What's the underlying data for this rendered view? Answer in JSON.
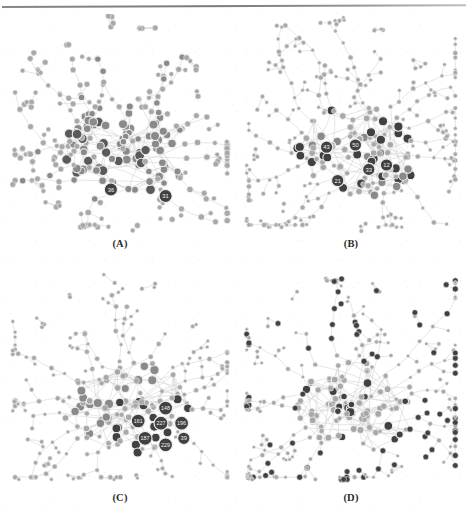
{
  "figure": {
    "kind": "network-graph-grid",
    "rows": 2,
    "columns": 2,
    "background_color": "#ffffff",
    "has_top_scan_rule": true
  },
  "chart_data": {
    "type": "scatter",
    "title": "",
    "subtitle": "",
    "xlabel": "",
    "ylabel": "",
    "grid": false,
    "legend_position": "none",
    "palette": {
      "background": "#ffffff",
      "edge": "#cfcfcf",
      "node_light": "#a8a8a8",
      "node_mid": "#8a8a8a",
      "node_dark": "#5a5a5a",
      "node_darkest": "#414141",
      "node_stroke": "#efefef",
      "label_text": "#f2f2f2",
      "caption_text": "#2c2c2c"
    },
    "panels": [
      {
        "id": "A",
        "caption": "(A)",
        "highlight_style": "graded-gray-by-degree",
        "node_count_approx": 240,
        "edge_count_approx": 300,
        "labeled_nodes": [
          {
            "label": "36",
            "x": 0.46,
            "y": 0.79
          },
          {
            "label": "31",
            "x": 0.7,
            "y": 0.82
          }
        ]
      },
      {
        "id": "B",
        "caption": "(B)",
        "highlight_style": "dark-hubs-center",
        "node_count_approx": 240,
        "edge_count_approx": 300,
        "labeled_nodes": [
          {
            "label": "43",
            "x": 0.39,
            "y": 0.6
          },
          {
            "label": "50",
            "x": 0.52,
            "y": 0.59
          },
          {
            "label": "21",
            "x": 0.44,
            "y": 0.75
          },
          {
            "label": "33",
            "x": 0.58,
            "y": 0.7
          },
          {
            "label": "12",
            "x": 0.66,
            "y": 0.68
          }
        ]
      },
      {
        "id": "C",
        "caption": "(C)",
        "highlight_style": "dark-cluster-lower-right",
        "node_count_approx": 240,
        "edge_count_approx": 300,
        "labeled_nodes": [
          {
            "label": "148",
            "x": 0.7,
            "y": 0.63
          },
          {
            "label": "227",
            "x": 0.68,
            "y": 0.7
          },
          {
            "label": "196",
            "x": 0.77,
            "y": 0.7
          },
          {
            "label": "161",
            "x": 0.58,
            "y": 0.69
          },
          {
            "label": "187",
            "x": 0.61,
            "y": 0.77
          },
          {
            "label": "229",
            "x": 0.7,
            "y": 0.8
          },
          {
            "label": "39",
            "x": 0.78,
            "y": 0.77
          }
        ]
      },
      {
        "id": "D",
        "caption": "(D)",
        "highlight_style": "many-uniform-dark-rings-dispersed",
        "node_count_approx": 240,
        "edge_count_approx": 300,
        "labeled_nodes": []
      }
    ]
  }
}
